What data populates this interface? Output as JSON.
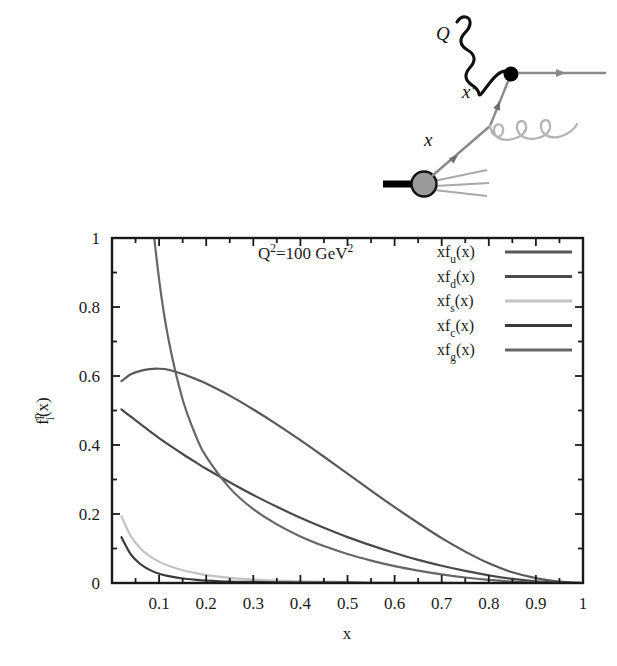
{
  "figure": {
    "title": "",
    "diagram": {
      "name": "deep-inelastic-scattering-diagram",
      "labels": {
        "photon": "Q",
        "struck_parton": "x'",
        "initial_parton": "x"
      },
      "elements": {
        "photon_line": "wavy-photon-line",
        "vertex": "interaction-vertex-dot",
        "outgoing_quark": "outgoing-quark-arrow",
        "gluon": "gluon-coil",
        "proton_blob": "proton-blob",
        "proton_line": "incoming-proton-line",
        "remnant_jets": "proton-remnant-jets"
      },
      "colors": {
        "photon": "#111111",
        "vertex": "#000000",
        "quark_line": "#8a8a8a",
        "gluon": "#b4b4b4",
        "proton_blob_fill": "#9a9a9a",
        "proton_blob_stroke": "#111111",
        "proton_line": "#000000",
        "remnants": "#a8a8a8"
      }
    }
  },
  "chart_data": {
    "type": "line",
    "title": "",
    "xlabel": "x",
    "ylabel": "f",
    "ylabel_sup": "p",
    "ylabel_sub": "i",
    "ylabel_tail": "(x)",
    "xlim": [
      0,
      1
    ],
    "ylim": [
      0,
      1
    ],
    "grid": false,
    "annotation": {
      "text_main": "Q",
      "text_sup1": "2",
      "text_mid": "=100 GeV",
      "text_sup2": "2",
      "full": "Q2=100 GeV2"
    },
    "legend_position": "top-right",
    "xticks": [
      0,
      0.1,
      0.2,
      0.3,
      0.4,
      0.5,
      0.6,
      0.7,
      0.8,
      0.9,
      1
    ],
    "xticklabels": [
      "",
      "0.1",
      "0.2",
      "0.3",
      "0.4",
      "0.5",
      "0.6",
      "0.7",
      "0.8",
      "0.9",
      "1"
    ],
    "yticks": [
      0,
      0.2,
      0.4,
      0.6,
      0.8,
      1
    ],
    "yticklabels": [
      "0",
      "0.2",
      "0.4",
      "0.6",
      "0.8",
      "1"
    ],
    "x": [
      0.02,
      0.04,
      0.06,
      0.08,
      0.1,
      0.12,
      0.15,
      0.18,
      0.2,
      0.25,
      0.3,
      0.35,
      0.4,
      0.45,
      0.5,
      0.55,
      0.6,
      0.65,
      0.7,
      0.75,
      0.8,
      0.85,
      0.9,
      0.95,
      1.0
    ],
    "series": [
      {
        "name": "xf_u(x)",
        "label_prefix": "xf",
        "label_sub": "u",
        "label_suffix": "(x)",
        "color": "#595959",
        "width": 2.2,
        "values": [
          0.585,
          0.605,
          0.615,
          0.62,
          0.621,
          0.618,
          0.606,
          0.59,
          0.578,
          0.543,
          0.503,
          0.46,
          0.414,
          0.366,
          0.317,
          0.268,
          0.22,
          0.174,
          0.13,
          0.091,
          0.057,
          0.031,
          0.014,
          0.004,
          0.0
        ]
      },
      {
        "name": "xf_d(x)",
        "label_prefix": "xf",
        "label_sub": "d",
        "label_suffix": "(x)",
        "color": "#4a4a4a",
        "width": 2.2,
        "values": [
          0.503,
          0.482,
          0.461,
          0.44,
          0.42,
          0.401,
          0.374,
          0.348,
          0.331,
          0.292,
          0.255,
          0.221,
          0.189,
          0.16,
          0.133,
          0.109,
          0.087,
          0.067,
          0.05,
          0.035,
          0.022,
          0.012,
          0.005,
          0.001,
          0.0
        ]
      },
      {
        "name": "xf_s(x)",
        "label_prefix": "xf",
        "label_sub": "s",
        "label_suffix": "(x)",
        "color": "#c2c2c2",
        "width": 2.2,
        "values": [
          0.193,
          0.136,
          0.101,
          0.078,
          0.062,
          0.05,
          0.037,
          0.028,
          0.023,
          0.015,
          0.01,
          0.007,
          0.005,
          0.004,
          0.003,
          0.002,
          0.001,
          0.001,
          0.001,
          0.0,
          0.0,
          0.0,
          0.0,
          0.0,
          0.0
        ]
      },
      {
        "name": "xf_c(x)",
        "label_prefix": "xf",
        "label_sub": "c",
        "label_suffix": "(x)",
        "color": "#3a3a3a",
        "width": 2.2,
        "values": [
          0.133,
          0.083,
          0.055,
          0.038,
          0.027,
          0.02,
          0.013,
          0.009,
          0.007,
          0.004,
          0.003,
          0.002,
          0.001,
          0.001,
          0.001,
          0.0,
          0.0,
          0.0,
          0.0,
          0.0,
          0.0,
          0.0,
          0.0,
          0.0,
          0.0
        ]
      },
      {
        "name": "xf_g(x)",
        "label_prefix": "xf",
        "label_sub": "g",
        "label_suffix": "(x)",
        "color": "#666666",
        "width": 2.2,
        "values": [
          4.35,
          2.35,
          1.56,
          1.14,
          0.88,
          0.706,
          0.532,
          0.42,
          0.366,
          0.275,
          0.214,
          0.17,
          0.135,
          0.107,
          0.084,
          0.065,
          0.049,
          0.036,
          0.025,
          0.016,
          0.009,
          0.004,
          0.001,
          0.0,
          0.0
        ]
      }
    ]
  }
}
